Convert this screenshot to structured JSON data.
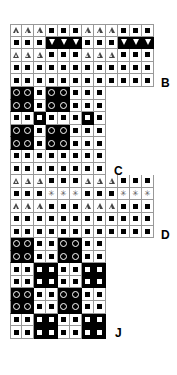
{
  "legend_codes": {
    "T": "white triangle on white",
    "S": "black square on white",
    "V": "white inverted triangle on black",
    "O": "white circle on black",
    "W": "white square on black",
    "X": "asterisk on white"
  },
  "labels": [
    {
      "text": "B",
      "x": 161,
      "y": 76
    },
    {
      "text": "C",
      "x": 114,
      "y": 164
    },
    {
      "text": "D",
      "x": 161,
      "y": 228
    },
    {
      "text": "J",
      "x": 115,
      "y": 326
    }
  ],
  "chart_data": {
    "type": "heatmap",
    "title": "",
    "rows": [
      [
        "T",
        "T",
        "T",
        "S",
        "S",
        "S",
        "T",
        "T",
        "T",
        "S",
        "S",
        "S"
      ],
      [
        "S",
        "S",
        "S",
        "V",
        "V",
        "V",
        "S",
        "S",
        "S",
        "V",
        "V",
        "V"
      ],
      [
        "T",
        "T",
        "T",
        "S",
        "S",
        "S",
        "T",
        "T",
        "T",
        "S",
        "S",
        "S"
      ],
      [
        "S",
        "S",
        "S",
        "S",
        "S",
        "S",
        "S",
        "S",
        "S",
        "S",
        "S",
        "S"
      ],
      [
        "S",
        "S",
        "S",
        "S",
        "S",
        "S",
        "S",
        "S",
        "S",
        "S",
        "S",
        "S"
      ],
      [
        "O",
        "O",
        "S",
        "O",
        "O",
        "S",
        "S",
        "S"
      ],
      [
        "O",
        "O",
        "S",
        "O",
        "O",
        "S",
        "S",
        "S"
      ],
      [
        "S",
        "S",
        "W",
        "S",
        "S",
        "S",
        "W",
        "S"
      ],
      [
        "O",
        "O",
        "S",
        "O",
        "O",
        "S",
        "S",
        "S"
      ],
      [
        "O",
        "O",
        "S",
        "O",
        "O",
        "S",
        "S",
        "S"
      ],
      [
        "S",
        "S",
        "S",
        "S",
        "S",
        "S",
        "S",
        "S"
      ],
      [
        "S",
        "S",
        "S",
        "S",
        "S",
        "S",
        "S",
        "S"
      ],
      [
        "T",
        "T",
        "T",
        "S",
        "S",
        "S",
        "T",
        "T",
        "T",
        "S",
        "S",
        "S"
      ],
      [
        "S",
        "S",
        "S",
        "X",
        "X",
        "X",
        "S",
        "S",
        "S",
        "X",
        "X",
        "X"
      ],
      [
        "T",
        "T",
        "T",
        "S",
        "S",
        "S",
        "T",
        "T",
        "T",
        "S",
        "S",
        "S"
      ],
      [
        "S",
        "S",
        "S",
        "S",
        "S",
        "S",
        "S",
        "S",
        "S",
        "S",
        "S",
        "S"
      ],
      [
        "S",
        "S",
        "S",
        "S",
        "S",
        "S",
        "S",
        "S",
        "S",
        "S",
        "S",
        "S"
      ],
      [
        "O",
        "O",
        "S",
        "S",
        "O",
        "O",
        "S",
        "S"
      ],
      [
        "O",
        "O",
        "S",
        "S",
        "O",
        "O",
        "S",
        "S"
      ],
      [
        "S",
        "S",
        "W",
        "W",
        "S",
        "S",
        "W",
        "W"
      ],
      [
        "S",
        "S",
        "W",
        "W",
        "S",
        "S",
        "W",
        "W"
      ],
      [
        "O",
        "O",
        "S",
        "S",
        "O",
        "O",
        "S",
        "S"
      ],
      [
        "O",
        "O",
        "S",
        "S",
        "O",
        "O",
        "S",
        "S"
      ],
      [
        "S",
        "S",
        "W",
        "W",
        "S",
        "S",
        "W",
        "W"
      ],
      [
        "S",
        "S",
        "W",
        "W",
        "S",
        "S",
        "W",
        "W"
      ]
    ],
    "section_labels": [
      {
        "after_row": 5,
        "label": "B"
      },
      {
        "after_row": 12,
        "label": "C"
      },
      {
        "after_row": 17,
        "label": "D"
      },
      {
        "after_row": 25,
        "label": "J"
      }
    ]
  }
}
